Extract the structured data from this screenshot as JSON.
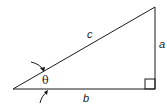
{
  "diagram": {
    "type": "right-triangle",
    "labels": {
      "hypotenuse": "c",
      "opposite": "a",
      "adjacent": "b",
      "angle": "θ"
    },
    "stroke_color": "#1a1a1a",
    "background": "#ffffff"
  }
}
